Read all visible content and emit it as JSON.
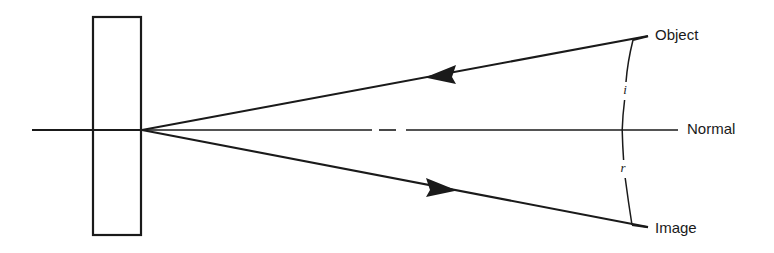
{
  "figure": {
    "type": "optics-ray-diagram",
    "width": 774,
    "height": 253,
    "background_color": "#ffffff",
    "ink_color": "#1a1a1a"
  },
  "labels": {
    "object": "Object",
    "image": "Image",
    "normal": "Normal",
    "angle_of_incidence": "i",
    "angle_of_reflection": "r"
  },
  "elements": {
    "mirror": {
      "name": "mirror-slab",
      "shape": "rectangle",
      "x": 93,
      "y": 17,
      "width": 48,
      "height": 218
    },
    "axis": {
      "name": "optical-axis",
      "from_x": 32,
      "to_x": 142,
      "y": 130
    },
    "normal_line": {
      "name": "normal-line",
      "from_x": 142,
      "to_x": 678,
      "y": 130,
      "dash_gaps": [
        [
          372,
          378
        ],
        [
          396,
          405
        ]
      ]
    },
    "incident_ray": {
      "name": "incident-ray",
      "from_x": 648,
      "from_y": 36,
      "to_x": 142,
      "to_y": 130,
      "arrow_direction": "toward-mirror",
      "arrow_x": 441,
      "arrow_y": 74
    },
    "reflected_ray": {
      "name": "reflected-ray",
      "from_x": 142,
      "from_y": 130,
      "to_x": 648,
      "to_y": 227,
      "arrow_direction": "away-from-mirror",
      "arrow_x": 441,
      "arrow_y": 187
    },
    "angle_arc": {
      "name": "angle-arc",
      "top_x": 633,
      "top_y": 40,
      "mid_x": 622,
      "mid_y": 130,
      "bottom_x": 632,
      "bottom_y": 225,
      "gap_i": [
        82,
        100
      ],
      "gap_r": [
        160,
        178
      ]
    },
    "label_leaders": {
      "object_leader": {
        "from_x": 633,
        "from_y": 40,
        "to_x": 648,
        "to_y": 36
      },
      "image_leader": {
        "from_x": 632,
        "from_y": 225,
        "to_x": 648,
        "to_y": 227
      }
    }
  },
  "label_positions": {
    "object": {
      "x": 655,
      "y": 36
    },
    "normal": {
      "x": 687,
      "y": 130
    },
    "image": {
      "x": 655,
      "y": 229
    },
    "i": {
      "x": 625,
      "y": 91
    },
    "r": {
      "x": 623,
      "y": 169
    }
  }
}
